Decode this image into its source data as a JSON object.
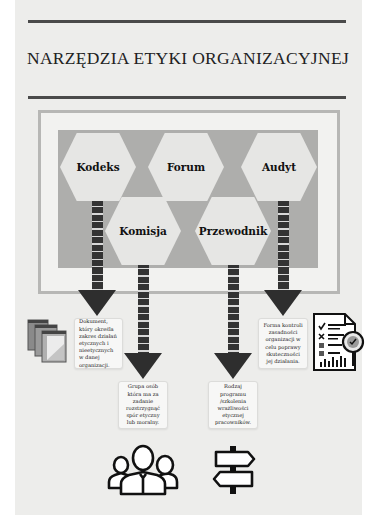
{
  "title": "NARZĘDZIA ETYKI ORGANIZACYJNEJ",
  "colors": {
    "page_bg": "#ededeb",
    "frame_border": "#b7b7b5",
    "inner_panel": "#aeaeac",
    "hexagon": "#e6e6e4",
    "arrow": "#2e2e2e",
    "rule": "#4a4a4a"
  },
  "tools": [
    {
      "id": "kodeks",
      "label": "Kodeks",
      "description": "Dokument, który określa zakres działań etycznych i nieetycznych w danej organizacji.",
      "icon": "books-icon"
    },
    {
      "id": "forum",
      "label": "Forum"
    },
    {
      "id": "audyt",
      "label": "Audyt",
      "description": "Forma kontroli zasadności organizacji w celu poprawy skuteczności jej działania.",
      "icon": "audit-report-icon"
    },
    {
      "id": "komisja",
      "label": "Komisja",
      "description": "Grupa osób która ma za zadanie rozstrzygnąć spór etyczny lub moralny.",
      "icon": "people-group-icon"
    },
    {
      "id": "przewodnik",
      "label": "Przewodnik",
      "description": "Rodzaj programu /szkolenia wrażliwości etycznej pracowników.",
      "icon": "signpost-icon"
    }
  ]
}
